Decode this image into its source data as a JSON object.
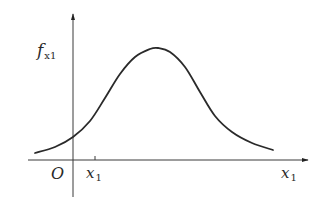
{
  "figure": {
    "type": "probability-density-curve",
    "y_axis_label": {
      "main": "f",
      "sub": "x1"
    },
    "x_axis_label": {
      "main": "x",
      "sub": "1"
    },
    "origin_label": "O",
    "tick_label": {
      "main": "x",
      "sub": "1"
    },
    "colors": {
      "curve": "#2a2a2a",
      "axis": "#3a3a3a",
      "background": "#ffffff"
    }
  },
  "chart_data": {
    "type": "line",
    "title": "",
    "xlabel": "x1",
    "ylabel": "f_x1",
    "points_px": [
      [
        35,
        153
      ],
      [
        55,
        147
      ],
      [
        73,
        137
      ],
      [
        90,
        121
      ],
      [
        105,
        98
      ],
      [
        120,
        74
      ],
      [
        135,
        57
      ],
      [
        150,
        49
      ],
      [
        158,
        48
      ],
      [
        170,
        52
      ],
      [
        185,
        67
      ],
      [
        200,
        92
      ],
      [
        215,
        116
      ],
      [
        232,
        132
      ],
      [
        252,
        143
      ],
      [
        273,
        150
      ]
    ],
    "axes_px": {
      "origin": [
        73,
        160
      ],
      "x_end": [
        308,
        160
      ],
      "y_end": [
        73,
        14
      ],
      "tick_x": 95
    },
    "grid": false,
    "legend": null
  }
}
